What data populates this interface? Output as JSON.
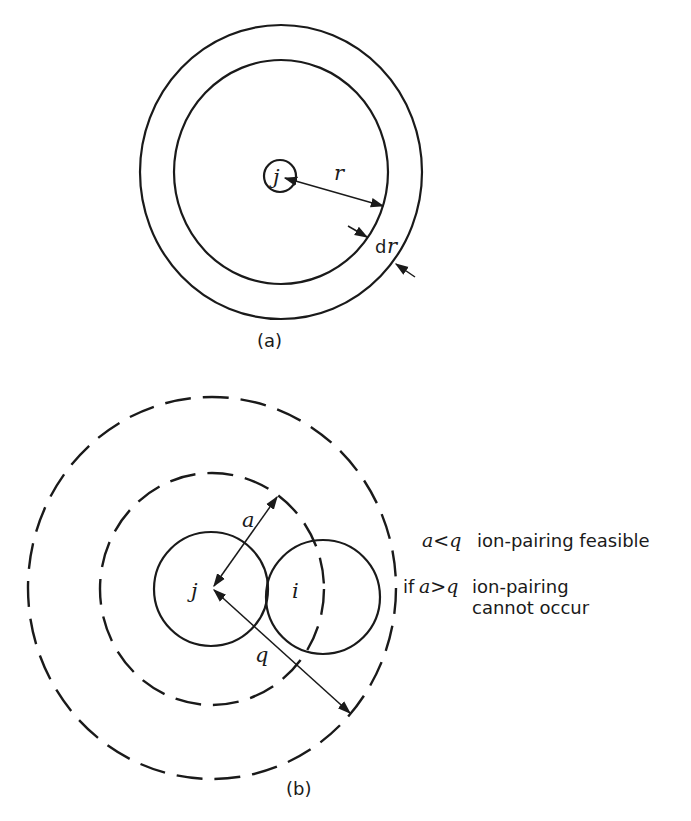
{
  "figure_a": {
    "caption": "(a)",
    "central_ion_label": "j",
    "radius_label": "r",
    "shell_label_d": "d",
    "shell_label_r": "r"
  },
  "figure_b": {
    "caption": "(b)",
    "ion_j_label": "j",
    "ion_i_label": "i",
    "distance_a_label": "a",
    "distance_q_label": "q",
    "annotations": [
      {
        "condition": "a<q",
        "text": "ion-pairing feasible"
      },
      {
        "prefix": "if",
        "condition": "a>q",
        "text": "ion-pairing",
        "continuation": "cannot occur"
      }
    ]
  },
  "colors": {
    "line": "#1a1a1a",
    "background": "#ffffff"
  }
}
